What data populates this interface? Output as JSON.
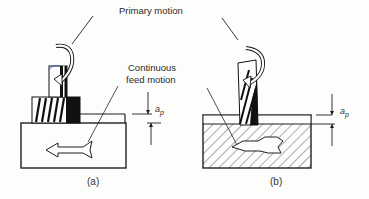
{
  "labels": {
    "primary_motion": "Primary motion",
    "continuous_feed_line1": "Continuous",
    "continuous_feed_line2": "feed motion",
    "depth_symbol_a": "a",
    "depth_subscript_a": "p",
    "depth_symbol_b": "a",
    "depth_subscript_b": "p",
    "caption_a": "(a)",
    "caption_b": "(b)"
  },
  "panels": [
    {
      "id": "a",
      "cutter": "slab-milling-cutter (helical teeth)",
      "workpiece": "plain rectangle",
      "feed_arrow": "left"
    },
    {
      "id": "b",
      "cutter": "end-mill (helical flutes)",
      "workpiece": "hatched rectangle",
      "feed_arrow": "left"
    }
  ],
  "colors": {
    "ink": "#1e1e1e",
    "paper": "#fdfdfb"
  }
}
